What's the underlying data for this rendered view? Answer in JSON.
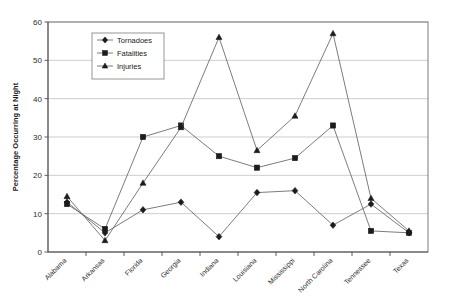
{
  "chart_data": {
    "type": "line",
    "title": "",
    "xlabel": "",
    "ylabel": "Percentage Occurring at Night",
    "ylim": [
      0,
      60
    ],
    "yticks": [
      0,
      10,
      20,
      30,
      40,
      50,
      60
    ],
    "grid": "horizontal",
    "legend_position": "upper-left-inside",
    "categories": [
      "Alabama",
      "Arkansas",
      "Florida",
      "Georgia",
      "Indiana",
      "Louisiana",
      "Mississippi",
      "North Carolina",
      "Tennessee",
      "Texas"
    ],
    "series": [
      {
        "name": "Tornadoes",
        "marker": "diamond",
        "values": [
          13,
          5,
          11,
          13,
          4,
          15.5,
          16,
          7,
          12.5,
          5
        ]
      },
      {
        "name": "Fatalities",
        "marker": "square",
        "values": [
          12.5,
          6,
          30,
          33,
          25,
          22,
          24.5,
          33,
          5.5,
          5
        ]
      },
      {
        "name": "Injuries",
        "marker": "triangle",
        "values": [
          14.5,
          3,
          18,
          32.5,
          56,
          26.5,
          35.5,
          57,
          14,
          5.5
        ]
      }
    ]
  },
  "colors": {
    "line": "#5a5a5a",
    "marker": "#1c1c1c",
    "grid": "#b9b9b9",
    "frame": "#6e6e6e",
    "background": "#ffffff"
  }
}
